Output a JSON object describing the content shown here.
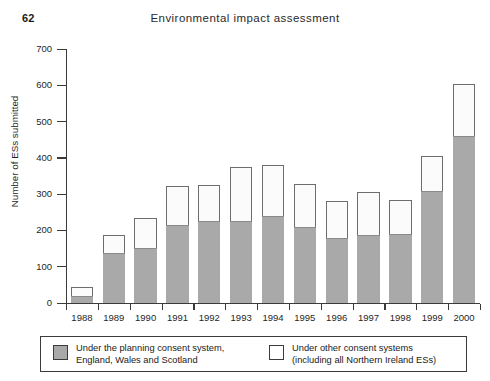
{
  "page": {
    "number": "62",
    "running_head": "Environmental impact assessment"
  },
  "chart_data": {
    "type": "bar",
    "subtype": "stacked-vertical",
    "title": "",
    "xlabel": "",
    "ylabel": "Number of ESs submitted",
    "ylim": [
      0,
      700
    ],
    "yticks": [
      0,
      100,
      200,
      300,
      400,
      500,
      600,
      700
    ],
    "ytick_labels": [
      "0",
      "100",
      "200",
      "300",
      "400",
      "500",
      "600",
      "700"
    ],
    "grid": false,
    "legend_position": "below-plot",
    "categories": [
      "1988",
      "1989",
      "1990",
      "1991",
      "1992",
      "1993",
      "1994",
      "1995",
      "1996",
      "1997",
      "1998",
      "1999",
      "2000"
    ],
    "series": [
      {
        "name": "Under the planning consent system, England, Wales and Scotland",
        "color": "#a9a9a9",
        "values": [
          20,
          138,
          152,
          215,
          225,
          225,
          240,
          210,
          180,
          188,
          190,
          310,
          460
        ]
      },
      {
        "name": "Under other consent systems (including all Northern Ireland ESs)",
        "color": "#fbfbfb",
        "values": [
          25,
          50,
          83,
          107,
          100,
          150,
          140,
          118,
          102,
          119,
          95,
          95,
          143
        ]
      }
    ],
    "totals": [
      45,
      188,
      235,
      322,
      325,
      375,
      380,
      328,
      282,
      307,
      285,
      405,
      603
    ]
  },
  "legend": {
    "entries": [
      {
        "swatch": "gray",
        "line1": "Under the planning consent system,",
        "line2": "England, Wales and Scotland"
      },
      {
        "swatch": "white",
        "line1": "Under other consent systems",
        "line2": "(including all Northern Ireland ESs)"
      }
    ]
  }
}
